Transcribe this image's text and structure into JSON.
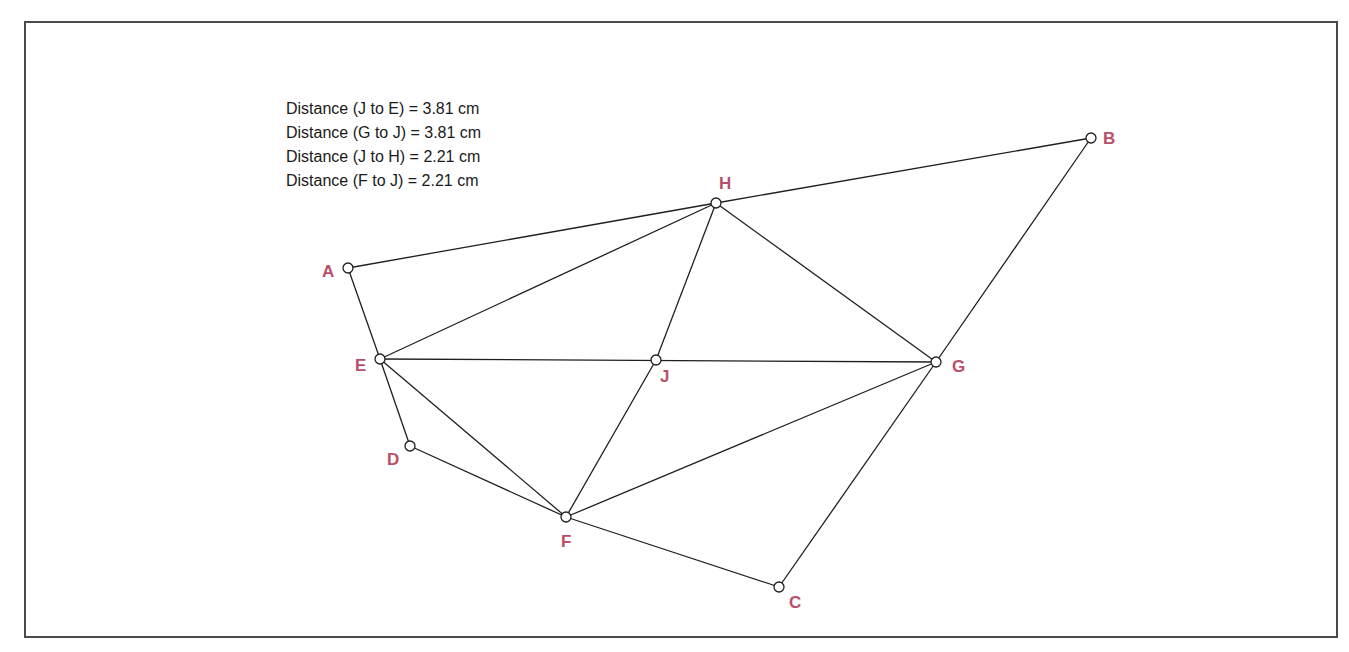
{
  "diagram": {
    "measurements": [
      "Distance (J to E) = 3.81 cm",
      "Distance (G to J) = 3.81 cm",
      "Distance (J to H) = 2.21 cm",
      "Distance (F to J) = 2.21 cm"
    ],
    "label_color": "#b8506a",
    "points": {
      "A": {
        "label": "A",
        "x": 348,
        "y": 268
      },
      "B": {
        "label": "B",
        "x": 1091,
        "y": 138
      },
      "C": {
        "label": "C",
        "x": 779,
        "y": 587
      },
      "D": {
        "label": "D",
        "x": 410,
        "y": 446
      },
      "E": {
        "label": "E",
        "x": 380,
        "y": 359
      },
      "F": {
        "label": "F",
        "x": 566,
        "y": 517
      },
      "G": {
        "label": "G",
        "x": 936,
        "y": 362
      },
      "H": {
        "label": "H",
        "x": 716,
        "y": 203
      },
      "J": {
        "label": "J",
        "x": 656,
        "y": 360
      }
    },
    "segments": [
      [
        "A",
        "H"
      ],
      [
        "H",
        "B"
      ],
      [
        "A",
        "E"
      ],
      [
        "B",
        "G"
      ],
      [
        "E",
        "D"
      ],
      [
        "D",
        "F"
      ],
      [
        "F",
        "C"
      ],
      [
        "C",
        "G"
      ],
      [
        "E",
        "H"
      ],
      [
        "H",
        "G"
      ],
      [
        "E",
        "G"
      ],
      [
        "H",
        "J"
      ],
      [
        "J",
        "F"
      ],
      [
        "E",
        "F"
      ],
      [
        "F",
        "G"
      ]
    ]
  }
}
